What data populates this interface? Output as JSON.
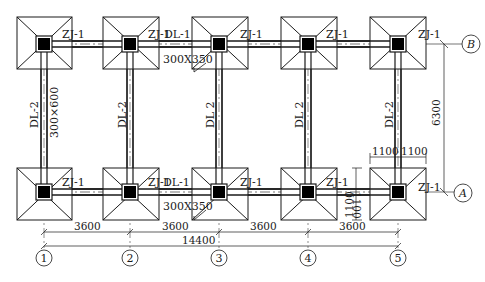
{
  "drawing": {
    "title": "Foundation plan",
    "colors": {
      "line": "#1a1a1a",
      "column": "#000000",
      "background": "#ffffff"
    },
    "footing_label": "ZJ-1",
    "tie_beam_horizontal": {
      "label": "DL-1",
      "section": "300X350"
    },
    "tie_beam_vertical": {
      "label": "DL-2",
      "label_alt": "DL 2",
      "section": "300×600"
    },
    "axes_x": [
      "1",
      "2",
      "3",
      "4",
      "5"
    ],
    "axes_y": [
      "A",
      "B"
    ],
    "dimensions": {
      "bays": [
        "3600",
        "3600",
        "3600",
        "3600"
      ],
      "total": "14400",
      "span_y": "6300",
      "footing_half_x": [
        "1100",
        "1100"
      ],
      "footing_half_y": [
        "1100",
        "1100"
      ]
    },
    "labels": {
      "dl2_col1": "DL-2",
      "dl2_col1_section": "300×600",
      "dl2_col2": "DL-2",
      "dl2_col3": "DL 2",
      "dl2_col4": "DL 2",
      "dl2_col5": "DL-2",
      "dl1_top": "DL-1",
      "dl1_top_section": "300X350",
      "dl1_bottom": "DL-1",
      "dl1_bottom_section": "300X350"
    }
  }
}
